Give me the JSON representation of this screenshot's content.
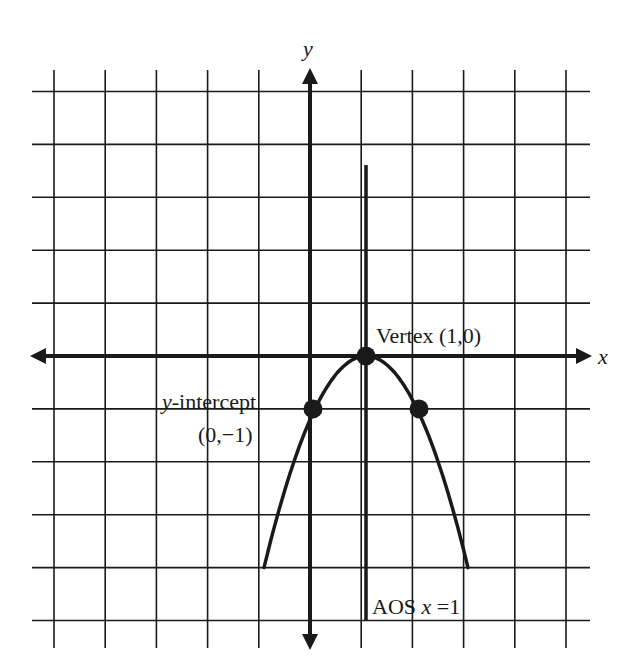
{
  "chart_data": {
    "type": "line",
    "title": "",
    "function": "y = -(x - 1)^2",
    "xlabel": "x",
    "ylabel": "y",
    "xlim": [
      -5,
      5
    ],
    "ylim": [
      -5,
      5
    ],
    "grid": true,
    "grid_step": 1,
    "curve": {
      "x": [
        -1,
        -0.5,
        0,
        0.5,
        1,
        1.5,
        2,
        2.5,
        3
      ],
      "y": [
        -4,
        -2.25,
        -1,
        -0.25,
        0,
        -0.25,
        -1,
        -2.25,
        -4
      ]
    },
    "points": [
      {
        "name": "y-intercept",
        "x": 0,
        "y": -1
      },
      {
        "name": "vertex",
        "x": 1,
        "y": 0
      },
      {
        "name": "symmetric-point",
        "x": 2,
        "y": -1
      }
    ],
    "axis_of_symmetry": {
      "x": 1,
      "y_range": [
        -5,
        3.6
      ]
    },
    "annotations": [
      {
        "text": "Vertex (1,0)",
        "at": [
          1,
          0
        ]
      },
      {
        "text_italic": "y",
        "text": "-intercept",
        "line2": "(0,−1)",
        "at": [
          0,
          -1
        ]
      },
      {
        "text": "AOS ",
        "text_italic": "x",
        "text_after": " =1",
        "at": [
          1,
          -5
        ]
      }
    ]
  },
  "labels": {
    "x_axis": "x",
    "y_axis": "y",
    "vertex": "Vertex (1,0)",
    "yint_italic": "y",
    "yint_rest": "-intercept",
    "yint_coords": "(0,−1)",
    "aos_prefix": "AOS ",
    "aos_var": "x",
    "aos_suffix": " =1"
  },
  "colors": {
    "ink": "#1a1a1a",
    "background": "#ffffff"
  }
}
